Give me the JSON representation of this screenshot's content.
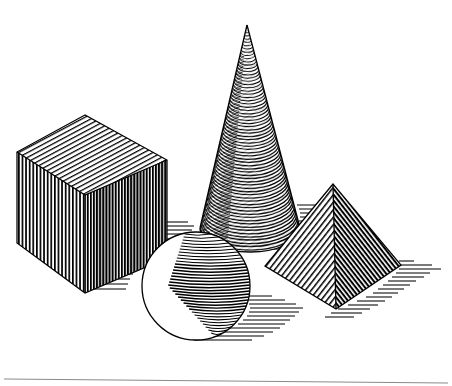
{
  "document": {
    "title": "Geometric Solids Hatched Line Drawing",
    "medium": "pen-and-ink cross-hatch illustration",
    "background_color": "#ffffff",
    "ink_color": "#000000",
    "width": 452,
    "height": 386
  },
  "scene": {
    "description": "Four hatched geometric solids on a white ground with cast shadows to the right",
    "light_direction": "upper-left",
    "ground_line": {
      "label": "ground-horizon-line",
      "color": "#8a8a8a",
      "x1": 4,
      "y1": 379,
      "x2": 448,
      "y2": 383
    },
    "objects": [
      {
        "id": "cube",
        "label": "Cube",
        "shading": "vertical-and-oblique-hatching",
        "faces": [
          {
            "name": "top-face",
            "tone": "light",
            "hatch": "parallel lines along depth axis"
          },
          {
            "name": "left-face",
            "tone": "mid",
            "hatch": "vertical lines"
          },
          {
            "name": "right-face",
            "tone": "dark",
            "hatch": "dense vertical lines"
          }
        ],
        "vertices": {
          "top_back": [
            85,
            115
          ],
          "top_left": [
            17,
            152
          ],
          "top_front": [
            85,
            195
          ],
          "top_right": [
            167,
            160
          ],
          "bot_left": [
            17,
            243
          ],
          "bot_front": [
            85,
            293
          ],
          "bot_right": [
            167,
            258
          ]
        }
      },
      {
        "id": "cone",
        "label": "Cone",
        "shading": "curved-contour-hatching",
        "apex": [
          247,
          25
        ],
        "base_center": [
          250,
          228
        ],
        "base_rx": 50,
        "base_ry": 24,
        "tone": "light-left-edge, dark-core, light-right-rim"
      },
      {
        "id": "sphere",
        "label": "Sphere",
        "shading": "crescent-contour-hatching",
        "center": [
          196,
          286
        ],
        "radius": 54,
        "highlight": "left-of-center white crescent"
      },
      {
        "id": "pyramid",
        "label": "Pyramid",
        "shading": "diagonal-hatching",
        "apex": [
          333,
          184
        ],
        "base_left": [
          265,
          266
        ],
        "base_front": [
          336,
          309
        ],
        "base_right": [
          401,
          265
        ],
        "faces": [
          {
            "name": "left-face",
            "tone": "mid",
            "hatch": "diagonal lines"
          },
          {
            "name": "right-face",
            "tone": "dark",
            "hatch": "dense diagonal lines"
          }
        ]
      }
    ],
    "shadows": [
      {
        "id": "cube-shadow",
        "label": "Cube cast shadow",
        "direction": "right"
      },
      {
        "id": "cone-shadow",
        "label": "Cone cast shadow",
        "direction": "right"
      },
      {
        "id": "sphere-shadow",
        "label": "Sphere cast shadow",
        "direction": "right"
      },
      {
        "id": "pyramid-shadow",
        "label": "Pyramid cast shadow",
        "direction": "right"
      }
    ]
  }
}
